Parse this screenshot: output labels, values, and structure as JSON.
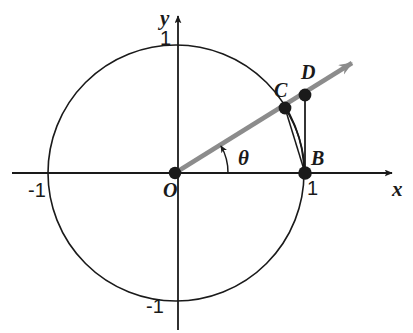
{
  "figure": {
    "type": "unit-circle-trigonometry-diagram",
    "colors": {
      "stroke": "#1a1a1a",
      "ray": "#8c8c8c",
      "background": "#ffffff",
      "point_fill": "#1a1a1a"
    },
    "axes": {
      "x_axis_label": "x",
      "y_axis_label": "y",
      "x_ticks": [
        "-1",
        "1"
      ],
      "y_ticks": [
        "1",
        "-1"
      ],
      "x_tick_left": "-1",
      "x_tick_right": "1",
      "y_tick_top": "1",
      "y_tick_bottom": "-1"
    },
    "points": [
      {
        "label": "O",
        "description": "origin",
        "x": 0,
        "y": 0
      },
      {
        "label": "B",
        "description": "point on circle at (1, 0)",
        "x": 1,
        "y": 0
      },
      {
        "label": "C",
        "description": "point where ray meets unit circle",
        "x": 0.85,
        "y": 0.51
      },
      {
        "label": "D",
        "description": "point on ray vertically above B",
        "x": 1,
        "y": 0.6
      }
    ],
    "angle": {
      "symbol": "θ",
      "description": "angle between positive x-axis and ray OD"
    },
    "elements": [
      "unit-circle",
      "x-axis-with-arrow",
      "y-axis-with-arrow",
      "ray-from-origin-with-arrow",
      "angle-arc-theta",
      "chord-CB",
      "arc-CB",
      "segment-DB"
    ]
  }
}
